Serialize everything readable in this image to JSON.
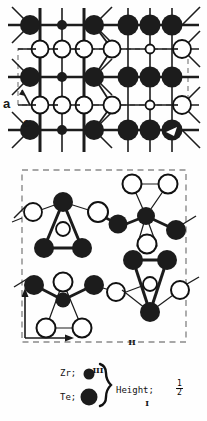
{
  "figure": {
    "type": "crystal-structure-projection-diagram",
    "panels": [
      {
        "id": "top",
        "label": "a",
        "axes": [
          {
            "name": "a",
            "label": "a",
            "direction": "up-left"
          },
          {
            "name": "c",
            "label": "c",
            "direction": "right"
          }
        ],
        "projection": "a-c plane"
      },
      {
        "id": "middle",
        "label": "b",
        "axes": [
          {
            "name": "b",
            "label": "b",
            "direction": "up"
          },
          {
            "name": "c",
            "label": "c",
            "direction": "right"
          }
        ],
        "projection": "b-c plane",
        "site_labels": [
          "I",
          "II",
          "III"
        ]
      }
    ],
    "site_label_I": "I",
    "site_label_II": "II",
    "site_label_III": "III",
    "panel_label_a": "a",
    "panel_label_b": "b",
    "axis_label_c_top": "c",
    "axis_label_c_bottom": "c"
  },
  "legend": {
    "zr_label": "Zr;",
    "te_label": "Te;",
    "height_label": "Height;",
    "height_value_numerator": "1",
    "height_value_denominator": "2",
    "zr_marker": "small-filled-circle",
    "te_marker": "large-filled-circle",
    "brace": "right-curly-brace"
  },
  "colors": {
    "atom_filled": "#1c1c1c",
    "atom_open_fill": "#ffffff",
    "atom_stroke": "#111111",
    "bond": "#1c1c1c",
    "cell_dashed": "#888888",
    "background": "#fefefe"
  }
}
